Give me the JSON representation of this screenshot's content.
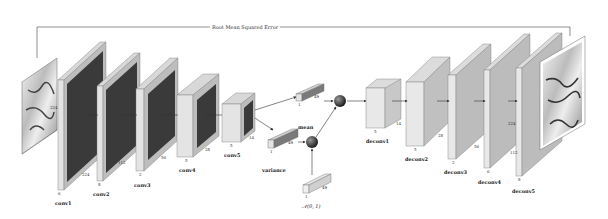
{
  "title": "Root Mean Squared Error",
  "input": {
    "size": "224"
  },
  "output": {
    "size": "224"
  },
  "encoder": [
    {
      "name": "conv1",
      "depth": "6",
      "size": "224"
    },
    {
      "name": "conv2",
      "depth": "8",
      "size": "112"
    },
    {
      "name": "conv3",
      "depth": "2",
      "size": "56"
    },
    {
      "name": "conv4",
      "depth": "5",
      "size": "28"
    },
    {
      "name": "conv5",
      "depth": "5",
      "size": "14"
    }
  ],
  "latent": {
    "mean": {
      "label": "mean",
      "depth": "1",
      "size": "49"
    },
    "variance": {
      "label": "variance",
      "depth": "1",
      "size": "49"
    },
    "noise": {
      "label": "𝒩(0, 1)",
      "depth": "1",
      "size": "49"
    }
  },
  "decoder": [
    {
      "name": "deconv1",
      "depth": "5",
      "size": "14"
    },
    {
      "name": "deconv2",
      "depth": "5",
      "size": "28"
    },
    {
      "name": "deconv3",
      "depth": "2",
      "size": "56"
    },
    {
      "name": "deconv4",
      "depth": "6",
      "size": "112"
    },
    {
      "name": "deconv5",
      "depth": "8",
      "size": "224"
    }
  ],
  "colors": {
    "dark_fill": "#3a3a3a",
    "light_fill": "#e4e4e4",
    "side_fill": "#bdbdbd",
    "edge": "#555555"
  }
}
